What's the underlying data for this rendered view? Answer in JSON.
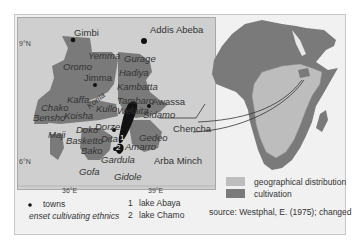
{
  "map": {
    "grid_labels": {
      "lat_9": "9°N",
      "lat_6": "6°N",
      "lon_36": "36°E",
      "lon_39": "39°E"
    },
    "towns": [
      "Gimbi",
      "Addis Abeba",
      "Jimma",
      "Awassa",
      "Chencha",
      "Arba Minch"
    ],
    "ethnics": [
      "Yemma",
      "Oromo",
      "Gurage",
      "Hadiya",
      "Kambatta",
      "Kaffa",
      "Konta",
      "Tambaro",
      "Chako",
      "Kullo",
      "Welaita",
      "Bensho",
      "Koisha",
      "Sidamo",
      "Dorze",
      "Dokō",
      "Maji",
      "Basketto",
      "Dita",
      "Gedeo",
      "Amarro",
      "Bako",
      "Gardula",
      "Gofa",
      "Gidole"
    ],
    "lake_markers": [
      "1",
      "2"
    ]
  },
  "labels": {
    "gimbi": "Gimbi",
    "addis": "Addis Abeba",
    "yemma": "Yemma",
    "gurage": "Gurage",
    "oromo": "Oromo",
    "jimma": "Jimma",
    "hadiya": "Hadiya",
    "kambatta": "Kambatta",
    "kaffa": "Kaffa",
    "konta": "Konta",
    "tambaro": "Tambaro",
    "awassa": "Awassa",
    "chako": "Chako",
    "kullo": "Kullo",
    "welaita": "Welaita",
    "bensho": "Bensho",
    "koisha": "Koisha",
    "sidamo": "Sidamo",
    "chencha": "Chencha",
    "dorze": "Dorze",
    "doko": "Doko",
    "maji": "Maji",
    "basketto": "Basketto",
    "dita": "Dita",
    "gedeo": "Gedeo",
    "amarro": "Amarro",
    "bako": "Bako",
    "gardula": "Gardula",
    "arba_minch": "Arba Minch",
    "gofa": "Gofa",
    "gidole": "Gidole",
    "lake1": "1",
    "lake2": "2"
  },
  "legend": {
    "towns": "towns",
    "ethnics": "enset cultivating ethnics",
    "lake1_num": "1",
    "lake1": "lake Abaya",
    "lake2_num": "2",
    "lake2": "lake Chamo",
    "geo_dist": "geographical distribution",
    "cultivation": "cultivation",
    "source": "source: Westphal, E. (1975); changed"
  },
  "colors": {
    "panel": "#cfcfcf",
    "cultivation": "#7a7a7a",
    "distribution": "#bdbdbd",
    "lakes": "#111111"
  }
}
